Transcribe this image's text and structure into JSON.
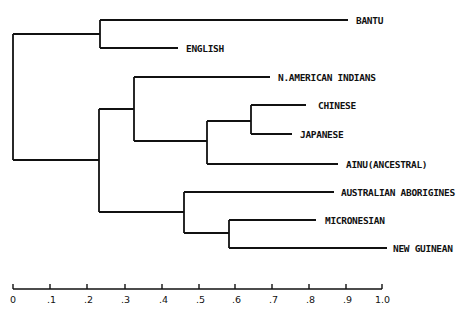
{
  "diagram": {
    "type": "dendrogram",
    "axis": {
      "min": 0,
      "max": 1.0,
      "ticks": [
        "0",
        ".1",
        ".2",
        ".3",
        ".4",
        ".5",
        ".6",
        ".7",
        ".8",
        ".9",
        "1.0"
      ]
    },
    "leaves": [
      {
        "id": "bantu",
        "label": "BANTU"
      },
      {
        "id": "english",
        "label": "ENGLISH"
      },
      {
        "id": "n_american_indians",
        "label": "N.AMERICAN INDIANS"
      },
      {
        "id": "chinese",
        "label": "CHINESE"
      },
      {
        "id": "japanese",
        "label": "JAPANESE"
      },
      {
        "id": "ainu",
        "label": "AINU(ANCESTRAL)"
      },
      {
        "id": "australian_aborigines",
        "label": "AUSTRALIAN ABORIGINES"
      },
      {
        "id": "micronesian",
        "label": "MICRONESIAN"
      },
      {
        "id": "new_guinean",
        "label": "NEW GUINEAN"
      }
    ],
    "merges": [
      {
        "children": [
          "bantu",
          "english"
        ],
        "height": 0.235
      },
      {
        "children": [
          "chinese",
          "japanese"
        ],
        "height": 0.645
      },
      {
        "children": [
          "chinese+japanese",
          "ainu"
        ],
        "height": 0.525
      },
      {
        "children": [
          "n_american_indians",
          "chinese+japanese+ainu"
        ],
        "height": 0.33
      },
      {
        "children": [
          "micronesian",
          "new_guinean"
        ],
        "height": 0.585
      },
      {
        "children": [
          "australian_aborigines",
          "micronesian+new_guinean"
        ],
        "height": 0.465
      },
      {
        "children": [
          "asian_cluster",
          "pacific_cluster"
        ],
        "height": 0.235
      },
      {
        "children": [
          "bantu+english",
          "rest"
        ],
        "height": 0.0
      }
    ]
  }
}
